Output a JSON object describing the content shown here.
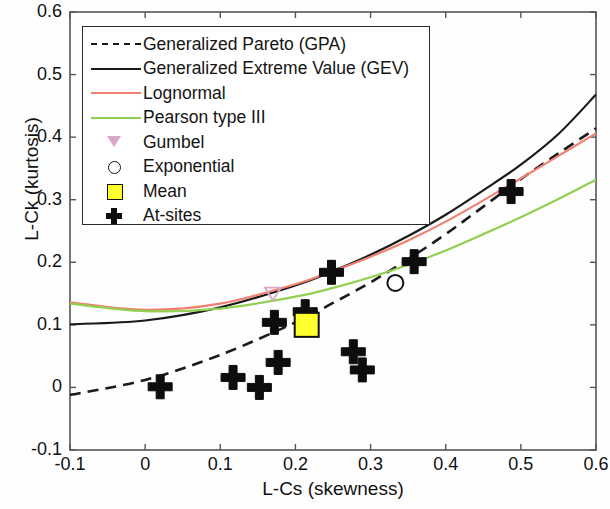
{
  "chart_data": {
    "type": "scatter",
    "title": "",
    "xlabel": "L-Cs (skewness)",
    "ylabel": "L-Ck (kurtosis)",
    "xlim": [
      -0.1,
      0.6
    ],
    "ylim": [
      -0.1,
      0.6
    ],
    "xticks": [
      "-0.1",
      "0",
      "0.1",
      "0.2",
      "0.3",
      "0.4",
      "0.5",
      "0.6"
    ],
    "yticks": [
      "-0.1",
      "0",
      "0.1",
      "0.2",
      "0.3",
      "0.4",
      "0.5",
      "0.6"
    ],
    "xtick_values": [
      -0.1,
      0,
      0.1,
      0.2,
      0.3,
      0.4,
      0.5,
      0.6
    ],
    "ytick_values": [
      -0.1,
      0,
      0.1,
      0.2,
      0.3,
      0.4,
      0.5,
      0.6
    ],
    "grid": false,
    "legend_position": "upper-left",
    "series": [
      {
        "name": "Generalized Pareto (GPA)",
        "type": "line",
        "style": "dashed",
        "color": "#1a1a1a",
        "x": [
          -0.1,
          0.0,
          0.1,
          0.2,
          0.25,
          0.3,
          0.35,
          0.4,
          0.45,
          0.5,
          0.55,
          0.6
        ],
        "y": [
          -0.012,
          0.012,
          0.052,
          0.104,
          0.135,
          0.168,
          0.205,
          0.245,
          0.289,
          0.333,
          0.374,
          0.414
        ]
      },
      {
        "name": "Generalized Extreme Value (GEV)",
        "type": "line",
        "style": "solid",
        "color": "#1a1a1a",
        "x": [
          -0.1,
          0.0,
          0.1,
          0.2,
          0.25,
          0.3,
          0.35,
          0.4,
          0.45,
          0.5,
          0.55,
          0.6
        ],
        "y": [
          0.101,
          0.107,
          0.128,
          0.163,
          0.186,
          0.212,
          0.242,
          0.276,
          0.315,
          0.356,
          0.405,
          0.468
        ]
      },
      {
        "name": "Lognormal",
        "type": "line",
        "style": "solid",
        "color": "#f08070",
        "x": [
          -0.1,
          0.0,
          0.1,
          0.2,
          0.25,
          0.3,
          0.35,
          0.4,
          0.45,
          0.5,
          0.55,
          0.6
        ],
        "y": [
          0.136,
          0.124,
          0.134,
          0.165,
          0.186,
          0.209,
          0.235,
          0.265,
          0.299,
          0.334,
          0.37,
          0.406
        ]
      },
      {
        "name": "Pearson type III",
        "type": "line",
        "style": "solid",
        "color": "#90d050",
        "x": [
          -0.1,
          0.0,
          0.1,
          0.2,
          0.25,
          0.3,
          0.35,
          0.4,
          0.45,
          0.5,
          0.55,
          0.6
        ],
        "y": [
          0.134,
          0.122,
          0.126,
          0.145,
          0.159,
          0.176,
          0.196,
          0.219,
          0.245,
          0.272,
          0.301,
          0.332
        ]
      },
      {
        "name": "At-sites",
        "type": "scatter",
        "marker": "plus",
        "color": "#0d0d0d",
        "points": [
          {
            "x": 0.02,
            "y": 0.001
          },
          {
            "x": 0.117,
            "y": 0.016
          },
          {
            "x": 0.152,
            "y": 0.0
          },
          {
            "x": 0.172,
            "y": 0.104
          },
          {
            "x": 0.177,
            "y": 0.04
          },
          {
            "x": 0.213,
            "y": 0.121
          },
          {
            "x": 0.248,
            "y": 0.184
          },
          {
            "x": 0.277,
            "y": 0.057
          },
          {
            "x": 0.289,
            "y": 0.028
          },
          {
            "x": 0.358,
            "y": 0.201
          },
          {
            "x": 0.487,
            "y": 0.313
          }
        ]
      },
      {
        "name": "Gumbel",
        "type": "scatter",
        "marker": "triangle-down",
        "color": "#d9a8c8",
        "points": [
          {
            "x": 0.17,
            "y": 0.15
          }
        ]
      },
      {
        "name": "Exponential",
        "type": "scatter",
        "marker": "circle",
        "color": "#111111",
        "points": [
          {
            "x": 0.333,
            "y": 0.167
          }
        ]
      },
      {
        "name": "Mean",
        "type": "scatter",
        "marker": "square",
        "color": "#ffff2e",
        "points": [
          {
            "x": 0.215,
            "y": 0.1
          }
        ]
      }
    ]
  },
  "legend": {
    "entries": [
      {
        "label": "Generalized Pareto (GPA)",
        "key": "dashed-line"
      },
      {
        "label": "Generalized Extreme Value (GEV)",
        "key": "solid-line"
      },
      {
        "label": "Lognormal",
        "key": "solid-line-salmon"
      },
      {
        "label": "Pearson type III",
        "key": "solid-line-green"
      },
      {
        "label": "Gumbel",
        "key": "triangle-down-marker"
      },
      {
        "label": "Exponential",
        "key": "circle-marker"
      },
      {
        "label": "Mean",
        "key": "yellow-square-marker"
      },
      {
        "label": "At-sites",
        "key": "plus-marker"
      }
    ]
  }
}
